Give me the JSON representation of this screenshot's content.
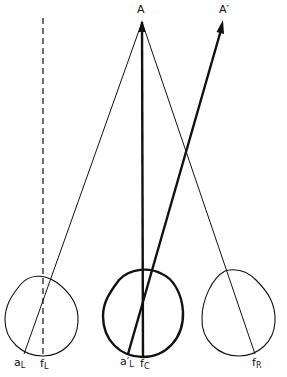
{
  "diagram": {
    "points": {
      "A": {
        "label": "A",
        "x": 142,
        "y": 20
      },
      "A_prime": {
        "label": "A′",
        "x": 223,
        "y": 20
      }
    },
    "eyes": [
      {
        "name": "left",
        "cx": 41,
        "cy": 318,
        "r": 37,
        "bold": false
      },
      {
        "name": "center",
        "cx": 143,
        "cy": 317,
        "r": 40,
        "bold": true
      },
      {
        "name": "right",
        "cx": 237,
        "cy": 318,
        "r": 37,
        "bold": false
      }
    ],
    "labels": {
      "A": "A",
      "A_prime": "A′",
      "aL_main": "a",
      "aL_sub": "L",
      "fL_main": "f",
      "fL_sub": "L",
      "aL2_main": "a′",
      "aL2_sub": "L",
      "fC_main": "f",
      "fC_sub": "C",
      "fR_main": "f",
      "fR_sub": "R"
    },
    "colors": {
      "ink": "#111111",
      "background": "#ffffff"
    }
  }
}
